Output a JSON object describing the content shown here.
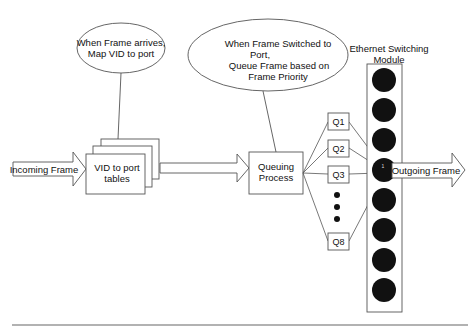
{
  "callouts": {
    "vid_mapping": {
      "lines": [
        "When Frame arrives,",
        "Map VID to port"
      ]
    },
    "queuing": {
      "lines": [
        "When Frame Switched  to",
        "Port,",
        "Queue Frame based on",
        "Frame Priority"
      ]
    }
  },
  "arrows": {
    "incoming": "Incoming Frame",
    "outgoing": "Outgoing Frame"
  },
  "boxes": {
    "vid_tables": [
      "VID to port",
      "tables"
    ],
    "queuing_process": [
      "Queuing",
      "Process"
    ]
  },
  "queues": [
    {
      "label": "Q1"
    },
    {
      "label": "Q2"
    },
    {
      "label": "Q3"
    },
    {
      "label": "Q8"
    }
  ],
  "module": {
    "title": [
      "Ethernet Switching",
      "Module"
    ],
    "port_count": 8,
    "active_port_label": "1"
  },
  "colors": {
    "stroke": "#555555",
    "port_fill": "#111111",
    "text": "#111111"
  }
}
